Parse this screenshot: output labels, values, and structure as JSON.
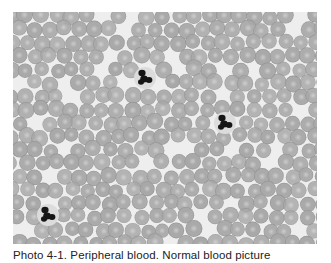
{
  "figure": {
    "caption": "Photo 4-1. Peripheral blood. Normal blood picture",
    "photo": {
      "description": "Blood smear micrograph, grayscale",
      "width": 304,
      "height": 232,
      "background_color": "#eeeeee",
      "rbc_color": "#a8a8a8",
      "rbc_center_color": "#c9c9c9",
      "rbc_edge_color": "#8f8f8f",
      "nucleus_color": "#161616",
      "rbc_radius": 7.8,
      "rbc_spacing": 15.2,
      "seed": 41,
      "neutrophils": [
        {
          "x": 132,
          "y": 66
        },
        {
          "x": 212,
          "y": 111
        },
        {
          "x": 35,
          "y": 203
        }
      ]
    }
  }
}
